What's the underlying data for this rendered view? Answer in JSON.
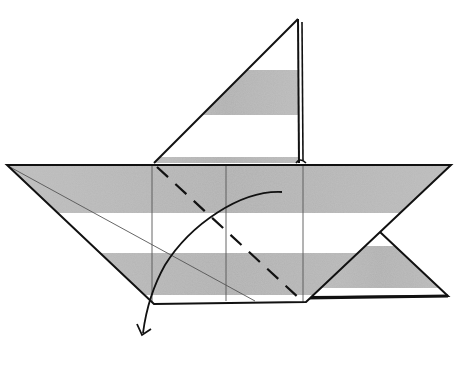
{
  "diagram": {
    "type": "origami-fold-step",
    "colors": {
      "background": "#ffffff",
      "outline": "#111111",
      "stripe": "#b4b4b4",
      "crease": "#555555"
    },
    "elements": {
      "upper_flap": "triangular flap pointing up",
      "main_body": "wide trapezoid with striped paper",
      "lower_right_flap": "small triangle behind right corner",
      "valley_fold_line": "dashed diagonal",
      "fold_arrow": "curved arrow pointing down-left",
      "creases": "thin vertical and diagonal crease lines"
    }
  }
}
